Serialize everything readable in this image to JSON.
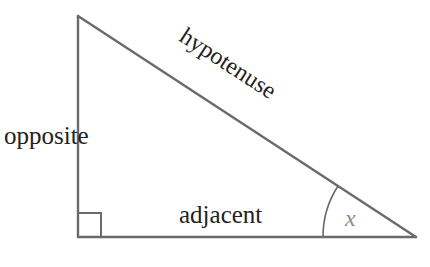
{
  "diagram": {
    "labels": {
      "hypotenuse": "hypotenuse",
      "opposite": "opposite",
      "adjacent": "adjacent",
      "angle": "x"
    },
    "colors": {
      "line": "#6a6a6a",
      "text": "#222222",
      "angle_text": "#8a8a8a"
    }
  }
}
